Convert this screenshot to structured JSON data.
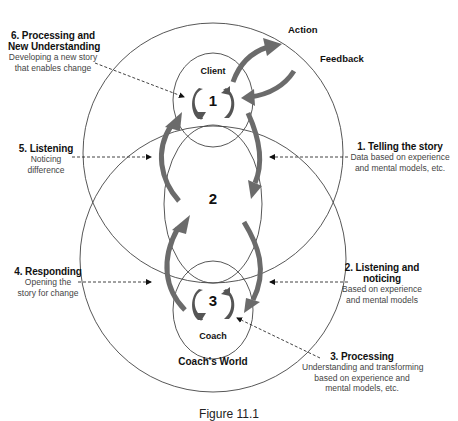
{
  "diagram": {
    "nodes": {
      "client": {
        "label": "Client",
        "number": "1"
      },
      "middle": {
        "number": "2"
      },
      "coach": {
        "label": "Coach",
        "number": "3"
      },
      "coach_world": {
        "label": "Coach's World"
      }
    },
    "outer_labels": {
      "action": "Action",
      "feedback": "Feedback"
    },
    "steps": [
      {
        "id": "1",
        "title": "1. Telling the story",
        "lines": [
          "Data based on experience",
          "and mental models, etc."
        ]
      },
      {
        "id": "2",
        "title_lines": [
          "2. Listening and",
          "noticing"
        ],
        "lines": [
          "Based on experience",
          "and mental models"
        ]
      },
      {
        "id": "3",
        "title": "3. Processing",
        "lines": [
          "Understanding and transforming",
          "based on experience and",
          "mental models, etc."
        ]
      },
      {
        "id": "4",
        "title": "4. Responding",
        "lines": [
          "Opening the",
          "story for change"
        ]
      },
      {
        "id": "5",
        "title": "5. Listening",
        "lines": [
          "Noticing",
          "difference"
        ]
      },
      {
        "id": "6",
        "title_lines": [
          "6. Processing and",
          "New Understanding"
        ],
        "lines": [
          "Developing a new story",
          "that enables change"
        ]
      }
    ],
    "caption": "Figure 11.1",
    "colors": {
      "line": "#444444",
      "arrow": "#6b6b6b",
      "text": "#111111",
      "subtext": "#444444"
    }
  }
}
